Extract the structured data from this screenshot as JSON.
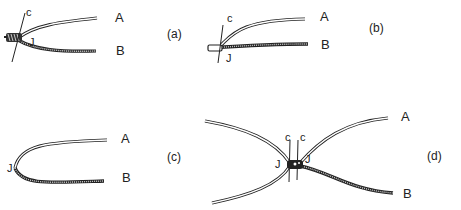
{
  "panels": [
    {
      "id": "a",
      "caption": "(a)",
      "labels": {
        "A": "A",
        "B": "B",
        "J": "J",
        "c": "c"
      }
    },
    {
      "id": "b",
      "caption": "(b)",
      "labels": {
        "A": "A",
        "B": "B",
        "J": "J",
        "c": "c"
      }
    },
    {
      "id": "c",
      "caption": "(c)",
      "labels": {
        "A": "A",
        "B": "B",
        "J": "J"
      }
    },
    {
      "id": "d",
      "caption": "(d)",
      "labels": {
        "A": "A",
        "B": "B",
        "J1": "J",
        "J2": "J",
        "c1": "c",
        "c2": "c"
      }
    }
  ],
  "colors": {
    "stroke": "#222222",
    "background": "#ffffff"
  }
}
